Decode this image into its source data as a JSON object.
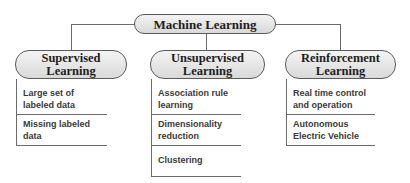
{
  "diagram": {
    "root": {
      "label": "Machine Learning"
    },
    "categories": [
      {
        "label_line1": "Supervised",
        "label_line2": "Learning",
        "items": [
          "Large set of labeled data",
          "Missing labeled data"
        ]
      },
      {
        "label_line1": "Unsupervised",
        "label_line2": "Learning",
        "items": [
          "Association rule learning",
          "Dimensionality reduction",
          "Clustering"
        ]
      },
      {
        "label_line1": "Reinforcement",
        "label_line2": "Learning",
        "items": [
          "Real time control and operation",
          "Autonomous Electric Vehicle"
        ]
      }
    ]
  }
}
